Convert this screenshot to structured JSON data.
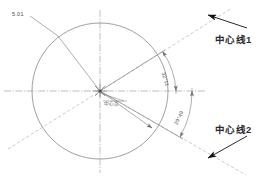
{
  "drawing": {
    "title": "Circle centerline angular dimension drawing",
    "background_color": "#ffffff",
    "line_color": "#8a8a8a",
    "centerline_color": "#a9a9a9",
    "text_color": "#2b2b2b"
  },
  "labels": {
    "dimension_length": "5.01",
    "center_point": "中心点",
    "centerline_1": "中心线1",
    "centerline_2": "中心线2",
    "angle_upper": "32°11",
    "angle_lower": "29°49"
  },
  "geometry": {
    "circle": {
      "cx": 100,
      "cy": 91,
      "r": 68
    },
    "horizontal_centerline": {
      "x1": 4,
      "y1": 91,
      "x2": 206,
      "y2": 91
    },
    "vertical_centerline": {
      "x1": 100,
      "y1": 10,
      "x2": 100,
      "y2": 172
    },
    "centerline_1_angle_deg": 32.18,
    "centerline_2_angle_deg": -29.82,
    "dimension_arc_radius_upper": 76,
    "dimension_arc_radius_lower": 92
  },
  "icons": {
    "leader_arrow_upper": "arrow-up-left",
    "leader_arrow_lower": "arrow-down-left",
    "angle_arrow": "arc-arrowhead",
    "center_marker": "center-cross-star"
  }
}
